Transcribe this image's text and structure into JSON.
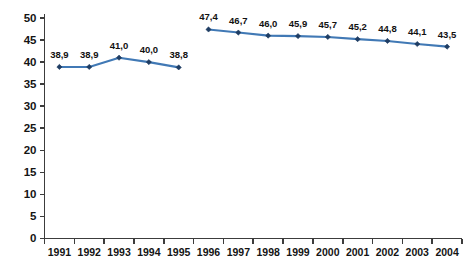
{
  "chart_data": {
    "type": "line",
    "title": "",
    "subtitle": "",
    "xlabel": "",
    "ylabel": "",
    "ylim": [
      0,
      50
    ],
    "xlim": [
      1991,
      2004
    ],
    "grid": false,
    "legend": "none",
    "decimal_separator": ",",
    "y_ticks": [
      "0",
      "5",
      "10",
      "15",
      "20",
      "25",
      "30",
      "35",
      "40",
      "45",
      "50"
    ],
    "y_tick_values": [
      0,
      5,
      10,
      15,
      20,
      25,
      30,
      35,
      40,
      45,
      50
    ],
    "categories": [
      "1991",
      "1992",
      "1993",
      "1994",
      "1995",
      "1996",
      "1997",
      "1998",
      "1999",
      "2000",
      "2001",
      "2002",
      "2003",
      "2004"
    ],
    "series": [
      {
        "name": "segment-1991-1995",
        "color": "#4179b5",
        "marker_color": "#1f3d63",
        "x": [
          "1991",
          "1992",
          "1993",
          "1994",
          "1995"
        ],
        "values": [
          38.9,
          38.9,
          41.0,
          40.0,
          38.8
        ],
        "labels": [
          "38,9",
          "38,9",
          "41,0",
          "40,0",
          "38,8"
        ]
      },
      {
        "name": "segment-1996-2004",
        "color": "#4179b5",
        "marker_color": "#1f3d63",
        "x": [
          "1996",
          "1997",
          "1998",
          "1999",
          "2000",
          "2001",
          "2002",
          "2003",
          "2004"
        ],
        "values": [
          47.4,
          46.7,
          46.0,
          45.9,
          45.7,
          45.2,
          44.8,
          44.1,
          43.5
        ],
        "labels": [
          "47,4",
          "46,7",
          "46,0",
          "45,9",
          "45,7",
          "45,2",
          "44,8",
          "44,1",
          "43,5"
        ]
      }
    ]
  },
  "colors": {
    "line": "#4179b5",
    "marker": "#1f3d63",
    "axis": "#3c3c3c",
    "text": "#111111",
    "background": "#ffffff"
  }
}
